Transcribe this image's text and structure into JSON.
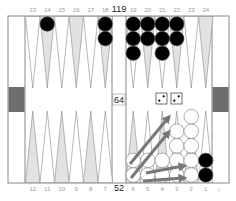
{
  "board": {
    "top_labels": [
      "13",
      "14",
      "15",
      "16",
      "17",
      "18",
      "19",
      "20",
      "21",
      "22",
      "23",
      "24"
    ],
    "bottom_labels": [
      "12",
      "11",
      "10",
      "9",
      "8",
      "7",
      "6",
      "5",
      "4",
      "3",
      "2",
      "1"
    ],
    "pip_top": "119",
    "pip_bottom": "52",
    "cube_value": "64",
    "off_indicator": "○"
  },
  "colors": {
    "frame": "#888888",
    "point_light": "#e2e2e2",
    "point_white": "#ffffff",
    "tray_block": "#6e6e6e",
    "black_checker": "#000000",
    "white_checker": "#ffffff",
    "arrow": "#777777"
  },
  "checkers": {
    "top": [
      {
        "point": "14",
        "color": "black",
        "count": 1
      },
      {
        "point": "18",
        "color": "black",
        "count": 2
      },
      {
        "point": "19",
        "color": "black",
        "count": 3
      },
      {
        "point": "20",
        "color": "black",
        "count": 2
      },
      {
        "point": "21",
        "color": "black",
        "count": 3
      },
      {
        "point": "22",
        "color": "black",
        "count": 2
      }
    ],
    "bottom": [
      {
        "point": "6",
        "color": "white",
        "count": 2
      },
      {
        "point": "5",
        "color": "white",
        "count": 2
      },
      {
        "point": "4",
        "color": "white",
        "count": 2
      },
      {
        "point": "3",
        "color": "white",
        "count": 4
      },
      {
        "point": "2",
        "color": "white",
        "count": 5
      },
      {
        "point": "1",
        "color": "black",
        "count": 2
      }
    ]
  },
  "dice": [
    2,
    2
  ],
  "moves": [
    "6/2",
    "6/3",
    "5/2",
    "4/2"
  ]
}
